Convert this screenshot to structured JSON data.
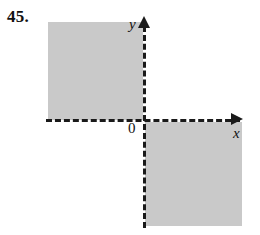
{
  "figure": {
    "problem_number": "45.",
    "axis_labels": {
      "x": "x",
      "y": "y",
      "origin": "0"
    },
    "colors": {
      "shading": "#c9c9c9",
      "axis": "#1a1a1a",
      "background": "#ffffff"
    }
  },
  "chart_data": {
    "type": "scatter",
    "title": "",
    "subtitle": "",
    "xlabel": "x",
    "ylabel": "y",
    "grid": false,
    "legend": "none",
    "origin_label": "0",
    "axes_style": "dashed",
    "shaded_quadrants": [
      "II",
      "IV"
    ],
    "regions": [
      {
        "name": "quadrant-II-region",
        "quadrant": "II",
        "x_range": [
          "negative",
          0
        ],
        "y_range": [
          0,
          "positive"
        ],
        "boundary": "dashed (not included)",
        "fill": "#c9c9c9"
      },
      {
        "name": "quadrant-IV-region",
        "quadrant": "IV",
        "x_range": [
          0,
          "positive"
        ],
        "y_range": [
          "negative",
          0
        ],
        "boundary": "dashed (not included)",
        "fill": "#c9c9c9"
      }
    ]
  }
}
